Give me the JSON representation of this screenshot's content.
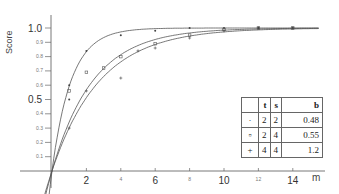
{
  "chart_data": {
    "type": "line",
    "title": "",
    "xlabel": "m",
    "ylabel": "Score",
    "xlim": [
      0,
      16
    ],
    "ylim": [
      0,
      1.05
    ],
    "x_ticks_major": [
      "2",
      "6",
      "10",
      "14"
    ],
    "x_ticks_minor": [
      "4",
      "8",
      "12"
    ],
    "y_ticks_major": [
      "0.5",
      "1.0"
    ],
    "y_ticks_minor": [
      "0.1",
      "0.2",
      "0.3",
      "0.4",
      "0.6",
      "0.7",
      "0.8",
      "0.9"
    ],
    "grid": false,
    "legend_position": "lower right table",
    "series": [
      {
        "name": "t=2, s=2, b=0.48",
        "marker": "dot",
        "points": [
          [
            1,
            0.6
          ],
          [
            1,
            0.5
          ],
          [
            2,
            0.84
          ],
          [
            4,
            0.95
          ],
          [
            6,
            0.98
          ],
          [
            8,
            1.0
          ],
          [
            10,
            1.0
          ],
          [
            12,
            1.0
          ],
          [
            14,
            1.0
          ]
        ]
      },
      {
        "name": "t=2, s=4, b=0.55",
        "marker": "square",
        "points": [
          [
            1,
            0.56
          ],
          [
            2,
            0.69
          ],
          [
            3,
            0.72
          ],
          [
            4,
            0.8
          ],
          [
            6,
            0.89
          ],
          [
            8,
            0.95
          ],
          [
            10,
            0.99
          ],
          [
            12,
            1.0
          ],
          [
            14,
            1.0
          ]
        ]
      },
      {
        "name": "t=4, s=4, b=1.2",
        "marker": "plus",
        "points": [
          [
            1,
            0.3
          ],
          [
            2,
            0.56
          ],
          [
            4,
            0.65
          ],
          [
            5,
            0.84
          ],
          [
            6,
            0.86
          ],
          [
            8,
            0.93
          ],
          [
            10,
            0.98
          ],
          [
            12,
            1.0
          ],
          [
            14,
            1.0
          ]
        ]
      }
    ],
    "table": {
      "headers": [
        "",
        "t",
        "s",
        "b"
      ],
      "rows": [
        [
          "·",
          "2",
          "2",
          "0.48"
        ],
        [
          "▫",
          "2",
          "4",
          "0.55"
        ],
        [
          "+",
          "4",
          "4",
          "1.2"
        ]
      ]
    }
  }
}
